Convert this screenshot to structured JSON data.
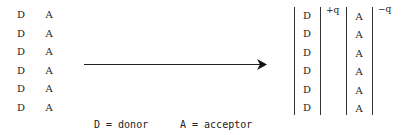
{
  "left_group": {
    "rows": [
      {
        "donor": "D",
        "acceptor": "A"
      },
      {
        "donor": "D",
        "acceptor": "A"
      },
      {
        "donor": "D",
        "acceptor": "A"
      },
      {
        "donor": "D",
        "acceptor": "A"
      },
      {
        "donor": "D",
        "acceptor": "A"
      },
      {
        "donor": "D",
        "acceptor": "A"
      }
    ]
  },
  "arrow": {
    "direction": "right"
  },
  "right_group": {
    "donor_layer": [
      "D",
      "D",
      "D",
      "D",
      "D",
      "D"
    ],
    "acceptor_layer": [
      "A",
      "A",
      "A",
      "A",
      "A",
      "A"
    ],
    "donor_charge": "+q",
    "acceptor_charge": "−q"
  },
  "legend": {
    "donor": "D = donor",
    "acceptor": "A = acceptor"
  }
}
